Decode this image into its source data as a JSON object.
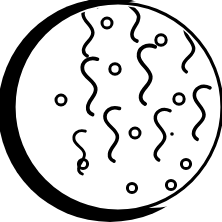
{
  "figure": {
    "title_fragment": "eal.",
    "alt": "Crescent-moon shaped black arc around a white disc speckled with squiggle and ring marks",
    "colors": {
      "ink": "#000000",
      "paper": "#ffffff"
    },
    "canvas": {
      "width": 222,
      "height": 222
    },
    "disc": {
      "name": "main-disc",
      "cx": 118,
      "cy": 107,
      "r": 104,
      "stroke_width": 3,
      "fill": "#ffffff"
    },
    "crescent": {
      "name": "crescent-shadow",
      "outer": {
        "cx": 110,
        "cy": 110,
        "rx": 112,
        "ry": 112
      },
      "inner": {
        "cx": 150,
        "cy": 104,
        "rx": 104,
        "ry": 104
      },
      "fill": "#000000"
    },
    "squiggles": [
      {
        "id": "squiggle-1",
        "x": 88,
        "y": 30,
        "scale": 1.0,
        "rotate": 4
      },
      {
        "id": "squiggle-2",
        "x": 133,
        "y": 14,
        "scale": 1.05,
        "rotate": -6
      },
      {
        "id": "squiggle-3",
        "x": 189,
        "y": 46,
        "scale": 1.0,
        "rotate": 8
      },
      {
        "id": "squiggle-4",
        "x": 90,
        "y": 86,
        "scale": 1.1,
        "rotate": -3
      },
      {
        "id": "squiggle-5",
        "x": 145,
        "y": 74,
        "scale": 1.15,
        "rotate": 2
      },
      {
        "id": "squiggle-6",
        "x": 199,
        "y": 112,
        "scale": 1.05,
        "rotate": 6
      },
      {
        "id": "squiggle-7",
        "x": 112,
        "y": 134,
        "scale": 1.05,
        "rotate": -2
      },
      {
        "id": "squiggle-8",
        "x": 160,
        "y": 134,
        "scale": 1.0,
        "rotate": 5
      },
      {
        "id": "squiggle-9",
        "x": 80,
        "y": 152,
        "scale": 0.85,
        "rotate": -4
      }
    ],
    "rings": [
      {
        "id": "ring-1",
        "cx": 107,
        "cy": 23,
        "r": 5.0
      },
      {
        "id": "ring-2",
        "cx": 161,
        "cy": 40,
        "r": 5.2
      },
      {
        "id": "ring-3",
        "cx": 115,
        "cy": 69,
        "r": 5.2
      },
      {
        "id": "ring-4",
        "cx": 61,
        "cy": 100,
        "r": 5.0
      },
      {
        "id": "ring-5",
        "cx": 179,
        "cy": 99,
        "r": 5.2
      },
      {
        "id": "ring-6",
        "cx": 135,
        "cy": 133,
        "r": 5.0
      },
      {
        "id": "ring-7",
        "cx": 83,
        "cy": 164,
        "r": 4.6
      },
      {
        "id": "ring-8",
        "cx": 186,
        "cy": 164,
        "r": 4.6
      },
      {
        "id": "ring-9",
        "cx": 132,
        "cy": 188,
        "r": 4.6
      },
      {
        "id": "ring-10",
        "cx": 171,
        "cy": 185,
        "r": 4.6
      }
    ],
    "dots": [
      {
        "id": "dot-1",
        "cx": 172,
        "cy": 134,
        "r": 1.6
      }
    ],
    "counts": {
      "squiggles": 9,
      "rings": 10,
      "dots": 1
    }
  }
}
